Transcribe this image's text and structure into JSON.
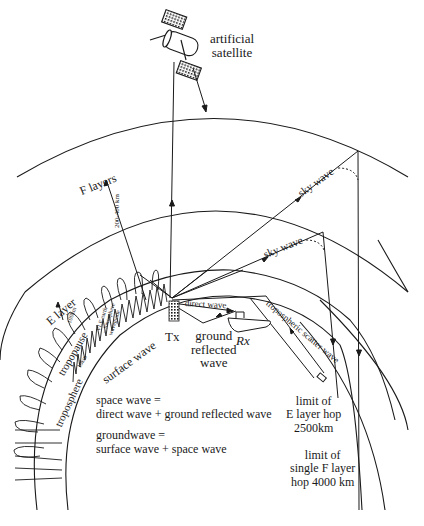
{
  "figure": {
    "colors": {
      "ink": "#1a1a1a",
      "background": "#ffffff"
    }
  },
  "labels": {
    "satellite": [
      "artificial",
      "satellite"
    ],
    "f_layers": "F layers",
    "f_height": "200-400 km",
    "e_layer": "E layer",
    "e_height": "100km",
    "sky_wave_upper": "sky wave",
    "sky_wave_lower": "sky wave",
    "vlf_waveguide": [
      "VLF earth",
      "– ionosphere",
      "waveguide"
    ],
    "tropopause": "tropopause",
    "tropo_height": "10km",
    "troposphere": "troposphere",
    "surface_wave": "surface wave",
    "tx": "Tx",
    "rx": "Rx",
    "direct_wave": "direct wave",
    "ground_reflected": [
      "ground",
      "reflected",
      "wave"
    ],
    "tropospheric_scatter": "tropospheric scatter wave",
    "space_wave_def": [
      "space wave =",
      "direct wave + ground reflected wave"
    ],
    "groundwave_def": [
      "groundwave =",
      "surface wave + space wave"
    ],
    "e_limit": [
      "limit of",
      "E layer hop",
      "2500km"
    ],
    "f_limit": [
      "limit of",
      "single F layer",
      "hop 4000 km"
    ]
  },
  "layers": [
    {
      "name": "F layer",
      "height": "200-400 km"
    },
    {
      "name": "E layer",
      "height": "100km"
    },
    {
      "name": "tropopause",
      "height": "10km"
    },
    {
      "name": "earth surface"
    }
  ],
  "hops": [
    {
      "layer": "E layer",
      "limit_km": 2500
    },
    {
      "layer": "single F layer",
      "limit_km": 4000
    }
  ]
}
